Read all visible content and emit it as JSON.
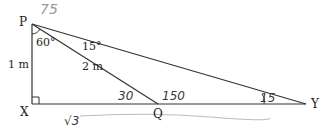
{
  "diagram": {
    "points": {
      "P": {
        "label": "P",
        "x": 32,
        "y": 24
      },
      "X": {
        "label": "X",
        "x": 32,
        "y": 104
      },
      "Q": {
        "label": "Q",
        "x": 158,
        "y": 104
      },
      "Y": {
        "label": "Y",
        "x": 306,
        "y": 104
      }
    },
    "printed_labels": {
      "side_px": "1 m",
      "side_pq": "2 m",
      "angle_xpq": "60°",
      "angle_qpy": "15°"
    },
    "handwritten_annotations": {
      "angle_at_p_total": "75",
      "angle_pqx": "30",
      "angle_pqy": "150",
      "angle_at_y": "15",
      "length_xq": "√3"
    },
    "colors": {
      "line": "#333333",
      "text": "#222222",
      "handwriting": "#3a3a3a",
      "handwriting_light": "#9a9a9a"
    }
  }
}
